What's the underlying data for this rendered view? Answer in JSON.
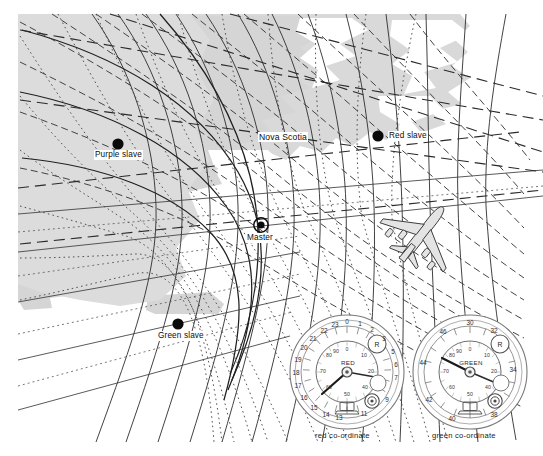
{
  "figure": {
    "type": "decca-navigator-hyperbolic-lattice-chart",
    "title_visible": false,
    "background_color": "#ffffff",
    "land_fill_color": "#d8d8d8",
    "lattice_colors": {
      "red_lane": "#2b2b2b",
      "green_lane": "#3a3a3a",
      "purple_lane": "#555555"
    }
  },
  "map": {
    "region_label": "Nova Scotia",
    "stations": [
      {
        "id": "master",
        "label": "Master",
        "marker": "donut",
        "x": 261,
        "y": 225,
        "label_x": 247,
        "label_y": 237
      },
      {
        "id": "red-slave",
        "label": "Red slave",
        "marker": "dot",
        "x": 378,
        "y": 136,
        "label_x": 388,
        "label_y": 132
      },
      {
        "id": "purple-slave",
        "label": "Purple slave",
        "marker": "dot",
        "x": 118,
        "y": 144,
        "label_x": 96,
        "label_y": 155
      },
      {
        "id": "green-slave",
        "label": "Green slave",
        "marker": "dot",
        "x": 178,
        "y": 324,
        "label_x": 159,
        "label_y": 336
      }
    ],
    "aircraft": {
      "name": "aircraft-silhouette",
      "x": 422,
      "y": 234,
      "heading_deg": 38
    }
  },
  "instruments": [
    {
      "id": "red-decometer",
      "caption": "red co-ordinate",
      "dial_name": "RED",
      "knob_label": "R",
      "outer_scale": [
        "0",
        "1",
        "2",
        "3",
        "4",
        "5",
        "6",
        "7",
        "8",
        "9",
        "10",
        "11",
        "12",
        "13",
        "14",
        "15",
        "16",
        "17",
        "18",
        "19",
        "20",
        "21",
        "22",
        "23"
      ],
      "outer_labeled": [
        "0",
        "1",
        "2",
        "3",
        "5",
        "6",
        "7",
        "9",
        "11",
        "13",
        "14",
        "15",
        "16",
        "17",
        "18",
        "19",
        "20",
        "21",
        "22",
        "23"
      ],
      "inner_scale": [
        "0",
        "10",
        "20",
        "30",
        "40",
        "50",
        "60",
        "70",
        "80",
        "90"
      ],
      "lane_pointer_deg": 236,
      "fraction_pointer_deg": 100,
      "center_x": 347,
      "center_y": 372,
      "radius": 57
    },
    {
      "id": "green-decometer",
      "caption": "green co-ordinate",
      "dial_name": "GREEN",
      "knob_label": "R",
      "outer_scale": [
        "30",
        "31",
        "32",
        "33",
        "34",
        "35",
        "36",
        "37",
        "38",
        "39",
        "40",
        "41",
        "42",
        "43",
        "44",
        "45",
        "46",
        "47"
      ],
      "outer_labeled": [
        "30",
        "32",
        "34",
        "38",
        "40",
        "42",
        "44",
        "46"
      ],
      "inner_scale": [
        "0",
        "10",
        "20",
        "30",
        "40",
        "50",
        "60",
        "70",
        "80",
        "90"
      ],
      "lane_pointer_deg": 251,
      "fraction_pointer_deg": 108,
      "center_x": 470,
      "center_y": 372,
      "radius": 57
    }
  ]
}
